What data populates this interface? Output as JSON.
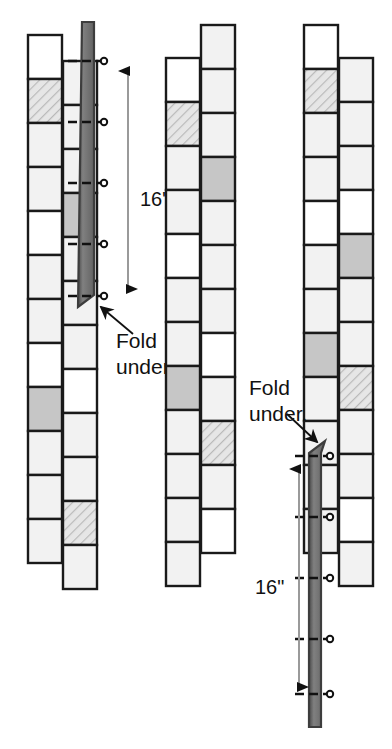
{
  "diagram": {
    "dimension_label": "16\"",
    "callout_label_line1": "Fold",
    "callout_label_line2": "under.",
    "colors": {
      "outline": "#1a1a1a",
      "cell_white": "#ffffff",
      "cell_light": "#f2f2f2",
      "cell_hatch": "#e0e0e0",
      "cell_gray": "#c6c6c6",
      "strip_dark": "#6e6e6e",
      "strip_edge": "#3d3d3d",
      "dim_line": "#9a9a9a",
      "arrow": "#111111",
      "pin": "#111111",
      "background": "#ffffff"
    },
    "cell_size": 44,
    "pin_count_per_strip": 5
  },
  "figures": [
    {
      "name": "figure-left",
      "x": 28,
      "strip_side": "right",
      "dimension": "16\"",
      "dim_x": 128,
      "dim_top": 58,
      "dim_bottom": 302,
      "dim_text_x": 140,
      "dim_text_y": 206,
      "callout": {
        "text1": "Fold",
        "text2": "under.",
        "x": 116,
        "y1": 348,
        "y2": 374,
        "arrow_from_x": 133,
        "arrow_from_y": 334,
        "arrow_to_x": 101,
        "arrow_to_y": 307
      },
      "fold_strip": {
        "x": 82,
        "top": 22,
        "bottom": 307,
        "width": 12
      },
      "pins_y": [
        61,
        122,
        183,
        244,
        296
      ],
      "columns": [
        {
          "name": "column-outer",
          "x": 28,
          "top": 35,
          "cells": [
            "white",
            "hatch",
            "light",
            "light",
            "white",
            "light",
            "light",
            "white",
            "gray",
            "light",
            "light",
            "light"
          ]
        },
        {
          "name": "column-inner",
          "x": 63,
          "top": 61,
          "cells": [
            "light",
            "light",
            "light",
            "gray",
            "light",
            "light",
            "light",
            "white",
            "light",
            "light",
            "hatch",
            "light"
          ]
        }
      ]
    },
    {
      "name": "figure-middle",
      "x": 166,
      "strip_side": "none",
      "columns": [
        {
          "name": "column-outer",
          "x": 166,
          "top": 58,
          "cells": [
            "white",
            "hatch",
            "light",
            "light",
            "white",
            "light",
            "light",
            "gray",
            "light",
            "light",
            "light",
            "light"
          ]
        },
        {
          "name": "column-inner",
          "x": 201,
          "top": 25,
          "cells": [
            "light",
            "light",
            "light",
            "gray",
            "light",
            "light",
            "light",
            "white",
            "light",
            "hatch",
            "light",
            "white"
          ]
        }
      ]
    },
    {
      "name": "figure-right",
      "x": 304,
      "strip_side": "left",
      "dimension": "16\"",
      "dim_x": 299,
      "dim_top": 456,
      "dim_bottom": 700,
      "dim_text_x": 255,
      "dim_text_y": 594,
      "callout": {
        "text1": "Fold",
        "text2": "under.",
        "x": 249,
        "y1": 395,
        "y2": 421,
        "arrow_from_x": 287,
        "arrow_from_y": 414,
        "arrow_to_x": 317,
        "arrow_to_y": 442
      },
      "fold_strip": {
        "x": 309,
        "top": 441,
        "bottom": 727,
        "width": 12
      },
      "pins_y": [
        456,
        517,
        578,
        639,
        694
      ],
      "columns": [
        {
          "name": "column-outer",
          "x": 304,
          "top": 25,
          "cells": [
            "white",
            "hatch",
            "light",
            "light",
            "white",
            "light",
            "light",
            "gray",
            "light",
            "light",
            "light",
            "light"
          ]
        },
        {
          "name": "column-inner",
          "x": 339,
          "top": 58,
          "cells": [
            "light",
            "light",
            "light",
            "white",
            "gray",
            "light",
            "light",
            "hatch",
            "light",
            "light",
            "white",
            "light"
          ]
        }
      ]
    }
  ]
}
